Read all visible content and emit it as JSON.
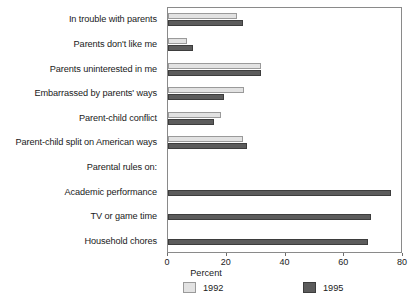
{
  "chart_data": {
    "type": "bar",
    "orientation": "horizontal",
    "title": "",
    "xlabel": "Percent",
    "ylabel": "",
    "xlim": [
      0,
      80
    ],
    "xticks": [
      0,
      20,
      40,
      60,
      80
    ],
    "grid": false,
    "legend_position": "bottom",
    "categories": [
      "In trouble with parents",
      "Parents don't like me",
      "Parents uninterested in me",
      "Embarrassed by parents' ways",
      "Parent-child conflict",
      "Parent-child split on American ways",
      "Parental rules on:",
      "Academic performance",
      "TV or game time",
      "Household chores"
    ],
    "series": [
      {
        "name": "1992",
        "color": "#e2e2e2",
        "values": [
          23.5,
          6.5,
          31.5,
          26.0,
          18.0,
          25.5,
          null,
          null,
          null,
          null
        ]
      },
      {
        "name": "1995",
        "color": "#5c5c5c",
        "values": [
          25.5,
          8.5,
          31.5,
          19.0,
          15.5,
          27.0,
          null,
          76.0,
          69.0,
          68.0
        ]
      }
    ]
  },
  "legend": {
    "items": [
      {
        "label": "1992",
        "swatch": "light-swatch"
      },
      {
        "label": "1995",
        "swatch": "dark-swatch"
      }
    ]
  },
  "axis": {
    "x_title": "Percent",
    "tick_labels": [
      "0",
      "20",
      "40",
      "60",
      "80"
    ]
  }
}
